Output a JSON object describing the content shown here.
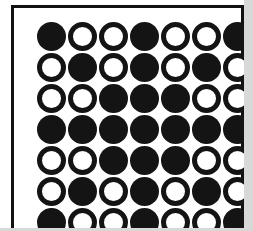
{
  "figure": {
    "kind": "dot-matrix-pattern",
    "rows": 7,
    "columns": 7,
    "filled_symbol": "●",
    "open_symbol": "○",
    "colors": {
      "ink": "#141414",
      "paper": "#ffffff",
      "frame": "#111111",
      "page_edge": "#d8d8d8"
    },
    "grid": [
      [
        "filled",
        "open",
        "open",
        "filled",
        "open",
        "open",
        "filled"
      ],
      [
        "open",
        "filled",
        "open",
        "filled",
        "open",
        "filled",
        "open"
      ],
      [
        "open",
        "open",
        "filled",
        "filled",
        "filled",
        "open",
        "open"
      ],
      [
        "filled",
        "filled",
        "filled",
        "filled",
        "filled",
        "filled",
        "filled"
      ],
      [
        "open",
        "open",
        "filled",
        "filled",
        "filled",
        "open",
        "open"
      ],
      [
        "open",
        "filled",
        "open",
        "filled",
        "open",
        "filled",
        "open"
      ],
      [
        "filled",
        "open",
        "open",
        "filled",
        "open",
        "open",
        "filled"
      ]
    ]
  }
}
